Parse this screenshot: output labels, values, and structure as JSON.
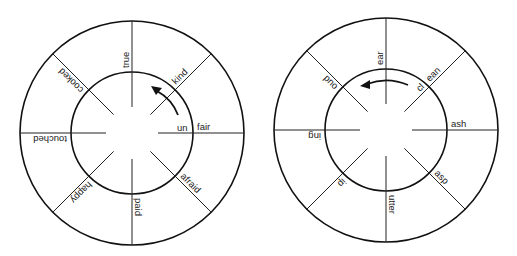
{
  "wheels": [
    {
      "id": "left-wheel",
      "cx": 132,
      "cy": 133,
      "outer_r": 112,
      "inner_r": 61,
      "spoke_start": 26,
      "center_label": "un",
      "arrow_direction": "counterclockwise",
      "words": [
        {
          "angle": 0,
          "text": "fair"
        },
        {
          "angle": -45,
          "text": "kind"
        },
        {
          "angle": -90,
          "text": "true"
        },
        {
          "angle": -135,
          "text": "cooked"
        },
        {
          "angle": 180,
          "text": "touched"
        },
        {
          "angle": 135,
          "text": "happy"
        },
        {
          "angle": 90,
          "text": "paid"
        },
        {
          "angle": 45,
          "text": "afraid"
        }
      ]
    },
    {
      "id": "right-wheel",
      "cx": 386,
      "cy": 130,
      "outer_r": 112,
      "inner_r": 61,
      "spoke_start": 26,
      "center_label": "cl",
      "arrow_direction": "counterclockwise",
      "words": [
        {
          "angle": 0,
          "text": "ash"
        },
        {
          "angle": -45,
          "text": "ean"
        },
        {
          "angle": -90,
          "text": "ear"
        },
        {
          "angle": -135,
          "text": "oud"
        },
        {
          "angle": 180,
          "text": "ing"
        },
        {
          "angle": 135,
          "text": "ip"
        },
        {
          "angle": 90,
          "text": "utter"
        },
        {
          "angle": 45,
          "text": "asp"
        }
      ]
    }
  ],
  "labels": {
    "left_prefix": "un",
    "right_prefix": "cl"
  }
}
